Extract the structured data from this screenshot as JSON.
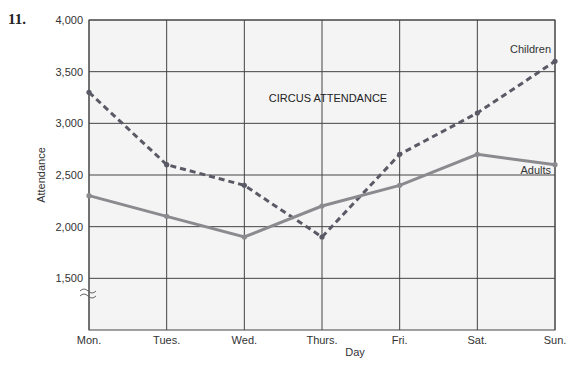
{
  "problem_number": "11.",
  "chart_data": {
    "type": "line",
    "title": "CIRCUS ATTENDANCE",
    "xlabel": "Day",
    "ylabel": "Attendance",
    "categories": [
      "Mon.",
      "Tues.",
      "Wed.",
      "Thurs.",
      "Fri.",
      "Sat.",
      "Sun."
    ],
    "y_ticks": [
      "1,500",
      "2,000",
      "2,500",
      "3,000",
      "3,500",
      "4,000"
    ],
    "ylim": [
      1000,
      4000
    ],
    "axis_break": true,
    "grid": true,
    "series": [
      {
        "name": "Children",
        "style": "dashed",
        "values": [
          3300,
          2600,
          2400,
          1900,
          2700,
          3100,
          3600
        ]
      },
      {
        "name": "Adults",
        "style": "solid",
        "values": [
          2300,
          2100,
          1900,
          2200,
          2400,
          2700,
          2600
        ]
      }
    ],
    "colors": {
      "children": "#5a5a66",
      "adults": "#8a8a8f",
      "grid": "#444444",
      "plot_bg": "#f4f4f4"
    }
  }
}
